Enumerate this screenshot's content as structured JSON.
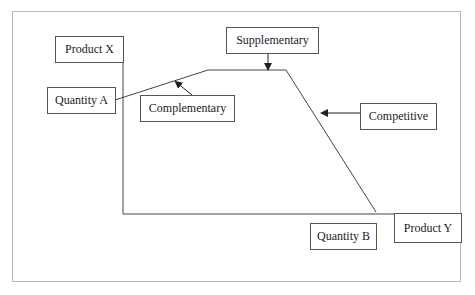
{
  "diagram": {
    "type": "production possibility / product relationship diagram",
    "labels": {
      "product_x": "Product X",
      "product_y": "Product Y",
      "quantity_a": "Quantity A",
      "quantity_b": "Quantity B",
      "complementary": "Complementary",
      "supplementary": "Supplementary",
      "competitive": "Competitive"
    },
    "curve_points": [
      [
        115,
        100
      ],
      [
        208,
        70
      ],
      [
        286,
        70
      ],
      [
        376,
        212
      ]
    ],
    "colors": {
      "line": "#444444",
      "frame": "#b9b9b9",
      "background": "#ffffff"
    }
  }
}
